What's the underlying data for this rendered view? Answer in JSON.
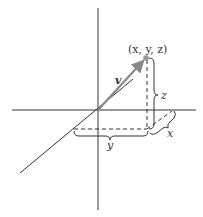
{
  "diagram": {
    "point_label": "(x, y, z)",
    "vector_label": "v",
    "component_labels": {
      "x": "x",
      "y": "y",
      "z": "z"
    },
    "colors": {
      "axes": "#333333",
      "vector": "#888888",
      "point": "#999999",
      "text": "#333333"
    }
  }
}
